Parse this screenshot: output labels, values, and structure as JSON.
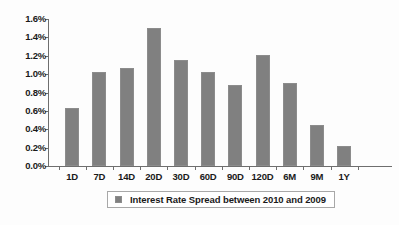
{
  "chart_data": {
    "type": "bar",
    "title": "",
    "xlabel": "",
    "ylabel": "",
    "categories": [
      "1D",
      "7D",
      "14D",
      "20D",
      "30D",
      "60D",
      "90D",
      "120D",
      "6M",
      "9M",
      "1Y"
    ],
    "values": [
      0.63,
      1.02,
      1.07,
      1.5,
      1.15,
      1.02,
      0.88,
      1.21,
      0.9,
      0.45,
      0.22
    ],
    "value_unit": "%",
    "ylim": [
      0.0,
      1.6
    ],
    "y_tick_values": [
      1.6,
      1.4,
      1.2,
      1.0,
      0.8,
      0.6,
      0.4,
      0.2,
      0.0
    ],
    "y_tick_labels": [
      "1.6%",
      "1.4%",
      "1.2%",
      "1.0%",
      "0.8%",
      "0.6%",
      "0.4%",
      "0.2%",
      "0.0%"
    ],
    "grid": false,
    "legend_position": "bottom",
    "series": [
      {
        "name": "Interest Rate Spread between 2010 and 2009",
        "color": "#808080",
        "values": [
          0.63,
          1.02,
          1.07,
          1.5,
          1.15,
          1.02,
          0.88,
          1.21,
          0.9,
          0.45,
          0.22
        ]
      }
    ]
  },
  "legend": {
    "label": "Interest Rate Spread between 2010 and 2009",
    "swatch_color": "#808080"
  },
  "colors": {
    "bar": "#808080",
    "axis": "#6e6e6e",
    "text": "#1a1a1a",
    "background": "#fdfdfd"
  }
}
